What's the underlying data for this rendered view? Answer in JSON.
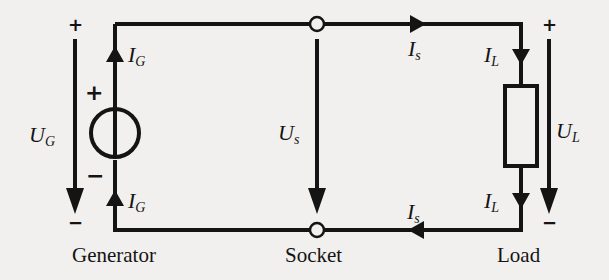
{
  "diagram": {
    "type": "circuit",
    "colors": {
      "wire": "#141414",
      "background": "#f1f0ee"
    },
    "components": {
      "generator": {
        "label": "Generator",
        "symbol": "ideal-voltage-source",
        "plus": "+",
        "minus": "−"
      },
      "socket": {
        "label": "Socket",
        "terminals": 2
      },
      "load": {
        "label": "Load",
        "symbol": "resistor-box"
      }
    },
    "labels": {
      "ug": {
        "base": "U",
        "sub": "G"
      },
      "ig_top": {
        "base": "I",
        "sub": "G"
      },
      "ig_bottom": {
        "base": "I",
        "sub": "G"
      },
      "us": {
        "base": "U",
        "sub": "s"
      },
      "is_top": {
        "base": "I",
        "sub": "s"
      },
      "is_bottom": {
        "base": "I",
        "sub": "s"
      },
      "il_top": {
        "base": "I",
        "sub": "L"
      },
      "il_bottom": {
        "base": "I",
        "sub": "L"
      },
      "ul": {
        "base": "U",
        "sub": "L"
      }
    },
    "polarity": {
      "ug_plus": "+",
      "ug_minus": "−",
      "ul_plus": "+",
      "ul_minus": "−"
    }
  }
}
